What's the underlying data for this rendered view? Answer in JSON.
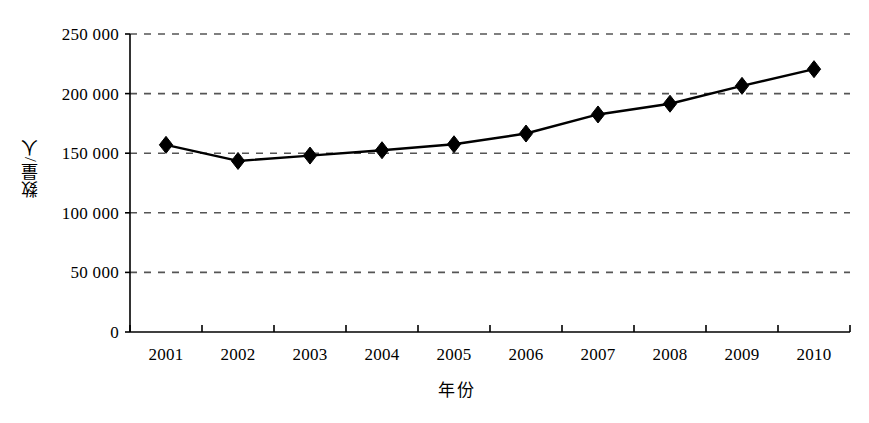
{
  "chart_data": {
    "type": "line",
    "title": "",
    "subtitle": "",
    "xlabel": "年份",
    "ylabel": "数量/人",
    "categories": [
      "2001",
      "2002",
      "2003",
      "2004",
      "2005",
      "2006",
      "2007",
      "2008",
      "2009",
      "2010"
    ],
    "values": [
      157000,
      143500,
      148000,
      152500,
      157500,
      166500,
      182500,
      191500,
      206500,
      220500
    ],
    "series": [
      {
        "name": "数量/人",
        "values": [
          157000,
          143500,
          148000,
          152500,
          157500,
          166500,
          182500,
          191500,
          206500,
          220500
        ],
        "marker": "diamond",
        "color": "#000000"
      }
    ],
    "ylim": [
      0,
      250000
    ],
    "yticks": [
      0,
      50000,
      100000,
      150000,
      200000,
      250000
    ],
    "ytick_labels": [
      "0",
      "50 000",
      "100 000",
      "150 000",
      "200 000",
      "250 000"
    ],
    "grid": "horizontal-dashed",
    "legend": "none",
    "line_color": "#000000",
    "grid_color": "#555555",
    "axis_color": "#000000",
    "background": "#ffffff"
  },
  "axis": {
    "y_title": "数量/人",
    "x_title": "年份"
  }
}
